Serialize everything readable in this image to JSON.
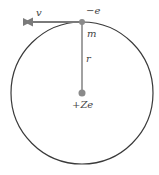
{
  "diagram": {
    "labels": {
      "velocity": "v",
      "electron": "−e",
      "mass": "m",
      "radius": "r",
      "nucleus": "+Ze"
    },
    "colors": {
      "orbit": "#3a3a3a",
      "arrow": "#7a7a7a",
      "nucleus": "#8a8a8a",
      "text": "#444444"
    },
    "geometry": {
      "center": [
        82,
        93
      ],
      "radius": 71
    }
  }
}
